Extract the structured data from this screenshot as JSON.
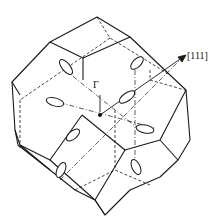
{
  "figure": {
    "type": "brillouin-zone",
    "labels": {
      "direction": "[111]",
      "center": "Γ"
    },
    "colors": {
      "line": "#1a1a1a",
      "background": "#ffffff"
    },
    "ellipsoid_count": 8
  }
}
